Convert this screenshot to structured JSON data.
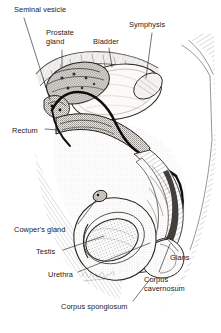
{
  "figure": {
    "style": "pen-and-ink anatomical engraving, black on white",
    "signature": "artist signature (handwritten, illegible)"
  },
  "labels": [
    {
      "id": "seminal-vesicle",
      "text": "Seminal vesicle",
      "x": 14,
      "y": 6,
      "lines": 1
    },
    {
      "id": "prostate-gland",
      "text": "Prostate\ngland",
      "x": 46,
      "y": 29,
      "lines": 2
    },
    {
      "id": "bladder",
      "text": "Bladder",
      "x": 93,
      "y": 38,
      "lines": 1
    },
    {
      "id": "symphysis",
      "text": "Symphysis",
      "x": 129,
      "y": 21,
      "lines": 1
    },
    {
      "id": "rectum",
      "text": "Rectum",
      "x": 12,
      "y": 127,
      "lines": 1
    },
    {
      "id": "cowpers-gland",
      "text": "Cowper's gland",
      "x": 14,
      "y": 226,
      "lines": 1
    },
    {
      "id": "testis",
      "text": "Testis",
      "x": 36,
      "y": 248,
      "lines": 1
    },
    {
      "id": "urethra",
      "text": "Urethra",
      "x": 48,
      "y": 271,
      "lines": 1
    },
    {
      "id": "glans",
      "text": "Glans",
      "x": 170,
      "y": 254,
      "lines": 1
    },
    {
      "id": "corpus-cavernosum",
      "text": "Corpus\ncavernosum",
      "x": 144,
      "y": 276,
      "lines": 2
    },
    {
      "id": "corpus-spongiosum",
      "text": "Corpus spongiosum",
      "x": 61,
      "y": 303,
      "lines": 1
    }
  ],
  "leaders": [
    {
      "id": "seminal-vesicle-leader",
      "from": [
        24,
        18
      ],
      "to": [
        50,
        100
      ]
    },
    {
      "id": "prostate-gland-leader",
      "from": [
        62,
        50
      ],
      "to": [
        62,
        66
      ]
    },
    {
      "id": "bladder-leader",
      "from": [
        109,
        48
      ],
      "to": [
        112,
        66
      ]
    },
    {
      "id": "symphysis-leader",
      "from": [
        152,
        33
      ],
      "to": [
        146,
        78
      ]
    },
    {
      "id": "rectum-leader",
      "from": [
        44,
        130
      ],
      "to": [
        56,
        131
      ]
    },
    {
      "id": "cowpers-gland-leader",
      "from": [
        76,
        224
      ],
      "to": [
        96,
        200
      ]
    },
    {
      "id": "testis-leader",
      "from": [
        62,
        250
      ],
      "to": [
        106,
        236
      ]
    },
    {
      "id": "urethra-leader",
      "from": [
        76,
        273
      ],
      "to": [
        150,
        243
      ]
    },
    {
      "id": "glans-leader",
      "from": [
        176,
        252
      ],
      "to": [
        163,
        237
      ]
    },
    {
      "id": "corpus-cavernosum-leader",
      "from": [
        158,
        273
      ],
      "to": [
        168,
        245
      ]
    },
    {
      "id": "corpus-spongiosum-leader",
      "from": [
        132,
        302
      ],
      "to": [
        150,
        280
      ]
    }
  ],
  "colors": {
    "ink": "#1a1a1a",
    "line": "#222222",
    "background": "#ffffff",
    "tissue_light": "#f0eeea",
    "tissue_mid": "#d8d4cd",
    "tissue_dark": "#8d8881",
    "duct_dark": "#111111"
  }
}
